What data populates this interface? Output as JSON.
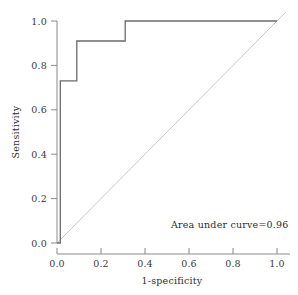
{
  "chart_data": {
    "type": "line",
    "title": "",
    "subtitle": "",
    "xlabel": "1-specificity",
    "ylabel": "Sensitivity",
    "xlim": [
      0.0,
      1.0
    ],
    "ylim": [
      0.0,
      1.0
    ],
    "grid": false,
    "legend": null,
    "xticks": [
      0.0,
      0.2,
      0.4,
      0.6,
      0.8,
      1.0
    ],
    "yticks": [
      0.0,
      0.2,
      0.4,
      0.6,
      0.8,
      1.0
    ],
    "xtick_labels": [
      "0.0",
      "0.2",
      "0.4",
      "0.6",
      "0.8",
      "1.0"
    ],
    "ytick_labels": [
      "0.0",
      "0.2",
      "0.4",
      "0.6",
      "0.8",
      "1.0"
    ],
    "series": [
      {
        "name": "ROC curve",
        "style": "step",
        "color": "#6b6b6b",
        "x": [
          0.0,
          0.015,
          0.015,
          0.09,
          0.09,
          0.31,
          0.31,
          1.0
        ],
        "y": [
          0.0,
          0.0,
          0.73,
          0.73,
          0.91,
          0.91,
          1.0,
          1.0
        ]
      },
      {
        "name": "Reference diagonal",
        "style": "line",
        "color": "#c9c9c9",
        "x": [
          0.0,
          1.04
        ],
        "y": [
          0.0,
          1.04
        ]
      }
    ],
    "annotations": [
      {
        "text": "Area under curve=0.96",
        "x": 0.52,
        "y": 0.105,
        "value": 0.96
      }
    ]
  },
  "axes": {
    "x_title": "1-specificity",
    "y_title": "Sensitivity",
    "x_tick_labels": [
      "0.0",
      "0.2",
      "0.4",
      "0.6",
      "0.8",
      "1.0"
    ],
    "y_tick_labels": [
      "0.0",
      "0.2",
      "0.4",
      "0.6",
      "0.8",
      "1.0"
    ]
  },
  "annotation": {
    "auc_label": "Area under curve=0.96"
  },
  "colors": {
    "background": "#ffffff",
    "roc_line": "#6b6b6b",
    "diagonal_line": "#c9c9c9",
    "axis": "#8a8a8a",
    "text": "#2e2e2e"
  }
}
